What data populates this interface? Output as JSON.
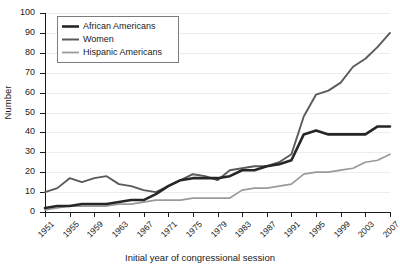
{
  "chart_data": {
    "type": "line",
    "title": "",
    "xlabel": "Initial year of congressional session",
    "ylabel": "Number",
    "xlim": [
      1951,
      2007
    ],
    "ylim": [
      0,
      100
    ],
    "grid": true,
    "legend_position": "top-left",
    "x_tick_labels": [
      "1951",
      "1955",
      "1959",
      "1963",
      "1967",
      "1971",
      "1975",
      "1979",
      "1983",
      "1987",
      "1991",
      "1995",
      "1999",
      "2003",
      "2007"
    ],
    "y_tick_labels": [
      "0",
      "10",
      "20",
      "30",
      "40",
      "50",
      "60",
      "70",
      "80",
      "90",
      "100"
    ],
    "x": [
      1951,
      1953,
      1955,
      1957,
      1959,
      1961,
      1963,
      1965,
      1967,
      1969,
      1971,
      1973,
      1975,
      1977,
      1979,
      1981,
      1983,
      1985,
      1987,
      1989,
      1991,
      1993,
      1995,
      1997,
      1999,
      2001,
      2003,
      2005,
      2007
    ],
    "series": [
      {
        "name": "African Americans",
        "color": "#262626",
        "width": 2.6,
        "values": [
          2,
          3,
          3,
          4,
          4,
          4,
          5,
          6,
          6,
          9,
          13,
          16,
          17,
          17,
          17,
          18,
          21,
          21,
          23,
          24,
          26,
          39,
          41,
          39,
          39,
          39,
          39,
          43,
          43
        ]
      },
      {
        "name": "Women",
        "color": "#5a5a5a",
        "width": 1.9,
        "values": [
          10,
          12,
          17,
          15,
          17,
          18,
          14,
          13,
          11,
          10,
          13,
          16,
          19,
          18,
          16,
          21,
          22,
          23,
          23,
          25,
          29,
          48,
          59,
          61,
          65,
          73,
          77,
          83,
          90
        ]
      },
      {
        "name": "Hispanic Americans",
        "color": "#9a9a9a",
        "width": 1.7,
        "values": [
          1,
          2,
          3,
          3,
          3,
          3,
          4,
          4,
          5,
          6,
          6,
          6,
          7,
          7,
          7,
          7,
          11,
          12,
          12,
          13,
          14,
          19,
          20,
          20,
          21,
          22,
          25,
          26,
          29
        ]
      }
    ]
  },
  "legend": {
    "items": [
      {
        "label": "African Americans"
      },
      {
        "label": "Women"
      },
      {
        "label": "Hispanic Americans"
      }
    ]
  },
  "axes": {
    "y_title": "Number",
    "x_title": "Initial year of congressional session"
  }
}
